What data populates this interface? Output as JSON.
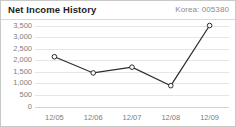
{
  "header": {
    "title": "Net Income History",
    "ticker_label": "Korea: 005380"
  },
  "colors": {
    "title": "#1d1d1d",
    "muted_text": "#7d7d7d",
    "line": "#2b2b2b",
    "grid": "#e6e6e6",
    "border": "#c8c8c8",
    "marker_fill": "#ffffff"
  },
  "chart_data": {
    "type": "line",
    "title": "Net Income History",
    "subtitle": "Korea: 005380",
    "xlabel": "",
    "ylabel": "",
    "categories": [
      "12/05",
      "12/06",
      "12/07",
      "12/08",
      "12/09"
    ],
    "values": [
      2150,
      1450,
      1700,
      900,
      3500
    ],
    "series": [
      {
        "name": "Net Income",
        "values": [
          2150,
          1450,
          1700,
          900,
          3500
        ]
      }
    ],
    "ylim": [
      0,
      3500
    ],
    "ytick_values": [
      3500,
      3000,
      2500,
      2000,
      1500,
      1000,
      500,
      0
    ],
    "ytick_labels": [
      "3,500",
      "3,000",
      "2,500",
      "2,000",
      "1,500",
      "1,000",
      "500",
      "0"
    ],
    "xtick_labels": [
      "12/05",
      "12/06",
      "12/07",
      "12/08",
      "12/09"
    ],
    "grid": true,
    "grid_axis": "y",
    "legend": false,
    "markers": "open-circle"
  }
}
